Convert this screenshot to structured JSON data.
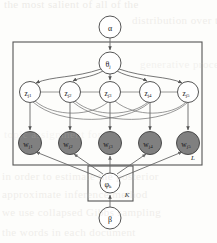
{
  "figure": {
    "type": "plate-notation-graphical-model",
    "title": "",
    "background_color": "#fdfdfb",
    "stroke_color": "#555555",
    "observed_fill": "#808080",
    "latent_fill": "#ffffff"
  },
  "nodes": {
    "alpha": {
      "id": "alpha",
      "label": "α",
      "subscript": "",
      "observed": false,
      "cx": 110,
      "cy": 27,
      "r": 11
    },
    "theta": {
      "id": "theta",
      "label": "θ",
      "subscript": "j",
      "observed": false,
      "cx": 110,
      "cy": 63,
      "r": 11
    },
    "beta": {
      "id": "beta",
      "label": "β",
      "subscript": "",
      "observed": false,
      "cx": 110,
      "cy": 218,
      "r": 11
    },
    "phi": {
      "id": "phi",
      "label": "φ",
      "subscript": "k",
      "observed": false,
      "cx": 110,
      "cy": 183,
      "r": 10
    }
  },
  "z_nodes": [
    {
      "id": "z1",
      "label": "z",
      "subscript": "j1",
      "observed": false,
      "cx": 30,
      "cy": 92,
      "r": 10.5
    },
    {
      "id": "z2",
      "label": "z",
      "subscript": "j2",
      "observed": false,
      "cx": 70,
      "cy": 92,
      "r": 10.5
    },
    {
      "id": "z3",
      "label": "z",
      "subscript": "j3",
      "observed": false,
      "cx": 110,
      "cy": 92,
      "r": 10.5
    },
    {
      "id": "z4",
      "label": "z",
      "subscript": "j4",
      "observed": false,
      "cx": 150,
      "cy": 92,
      "r": 10.5
    },
    {
      "id": "z5",
      "label": "z",
      "subscript": "j5",
      "observed": false,
      "cx": 188,
      "cy": 92,
      "r": 10.5
    }
  ],
  "w_nodes": [
    {
      "id": "w1",
      "label": "w",
      "subscript": "j1",
      "observed": true,
      "cx": 30,
      "cy": 143,
      "r": 11.5
    },
    {
      "id": "w2",
      "label": "w",
      "subscript": "j2",
      "observed": true,
      "cx": 70,
      "cy": 143,
      "r": 11.5
    },
    {
      "id": "w3",
      "label": "w",
      "subscript": "j3",
      "observed": true,
      "cx": 110,
      "cy": 143,
      "r": 11.5
    },
    {
      "id": "w4",
      "label": "w",
      "subscript": "j4",
      "observed": true,
      "cx": 150,
      "cy": 143,
      "r": 11.5
    },
    {
      "id": "w5",
      "label": "w",
      "subscript": "j5",
      "observed": true,
      "cx": 188,
      "cy": 143,
      "r": 11.5
    }
  ],
  "plates": [
    {
      "id": "document-plate",
      "label": "L",
      "x": 13,
      "y": 42,
      "width": 189,
      "height": 123,
      "label_x": 193,
      "label_y": 158
    },
    {
      "id": "topic-plate",
      "label": "K",
      "x": 88,
      "y": 166,
      "width": 45,
      "height": 35,
      "label_x": 127,
      "label_y": 195
    }
  ],
  "edges": [
    {
      "from": "alpha",
      "to": "theta",
      "kind": "arrow"
    },
    {
      "from": "theta",
      "to": "z1",
      "kind": "arrow"
    },
    {
      "from": "theta",
      "to": "z2",
      "kind": "arrow"
    },
    {
      "from": "theta",
      "to": "z3",
      "kind": "arrow"
    },
    {
      "from": "theta",
      "to": "z4",
      "kind": "arrow"
    },
    {
      "from": "theta",
      "to": "z5",
      "kind": "arrow"
    },
    {
      "from": "z1",
      "to": "w1",
      "kind": "arrow"
    },
    {
      "from": "z2",
      "to": "w2",
      "kind": "arrow"
    },
    {
      "from": "z3",
      "to": "w3",
      "kind": "arrow"
    },
    {
      "from": "z4",
      "to": "w4",
      "kind": "arrow"
    },
    {
      "from": "z5",
      "to": "w5",
      "kind": "arrow"
    },
    {
      "from": "z1",
      "to": "z2",
      "kind": "link"
    },
    {
      "from": "z2",
      "to": "z3",
      "kind": "link"
    },
    {
      "from": "z3",
      "to": "z4",
      "kind": "link"
    },
    {
      "from": "z4",
      "to": "z5",
      "kind": "link"
    },
    {
      "from": "z1",
      "to": "z3",
      "kind": "arc"
    },
    {
      "from": "z2",
      "to": "z4",
      "kind": "arc"
    },
    {
      "from": "z3",
      "to": "z5",
      "kind": "arc"
    },
    {
      "from": "z1",
      "to": "z4",
      "kind": "arc"
    },
    {
      "from": "z2",
      "to": "z5",
      "kind": "arc"
    },
    {
      "from": "beta",
      "to": "phi",
      "kind": "arrow"
    },
    {
      "from": "phi",
      "to": "w1",
      "kind": "arrow"
    },
    {
      "from": "phi",
      "to": "w2",
      "kind": "arrow"
    },
    {
      "from": "phi",
      "to": "w3",
      "kind": "arrow"
    },
    {
      "from": "phi",
      "to": "w4",
      "kind": "arrow"
    },
    {
      "from": "phi",
      "to": "w5",
      "kind": "arrow"
    }
  ],
  "bleed_text": [
    {
      "text": "the most salient of all of the",
      "top": -2,
      "left": 4,
      "opacity": 0.35
    },
    {
      "text": "distribution over the",
      "top": 14,
      "left": 132,
      "opacity": 0.3
    },
    {
      "text": "generative process",
      "top": 58,
      "left": 140,
      "opacity": 0.22
    },
    {
      "text": "topic assignment for",
      "top": 128,
      "left": 4,
      "opacity": 0.18
    },
    {
      "text": "in order to estimate the posterior",
      "top": 170,
      "left": 2,
      "opacity": 0.3
    },
    {
      "text": "approximate inference method",
      "top": 188,
      "left": 2,
      "opacity": 0.3
    },
    {
      "text": "we use collapsed Gibbs sampling",
      "top": 206,
      "left": 2,
      "opacity": 0.3
    },
    {
      "text": "the words in each document",
      "top": 226,
      "left": 2,
      "opacity": 0.3
    }
  ]
}
